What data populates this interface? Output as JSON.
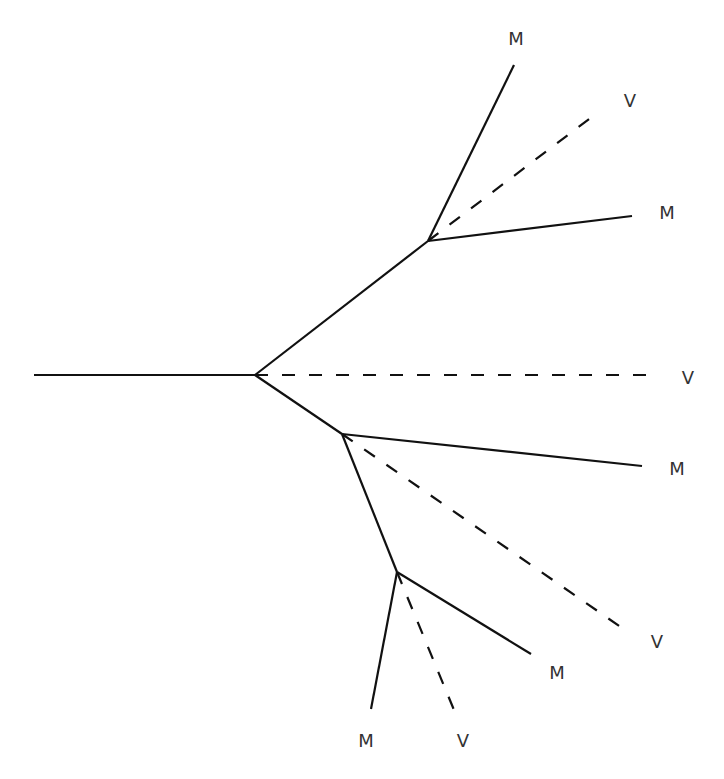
{
  "diagram": {
    "type": "phylogenetic-tree",
    "stroke_color": "#111111",
    "label_color": "#333333",
    "legend_semantics": {
      "solid": "M",
      "dashed": "V"
    },
    "nodes": {
      "root_start": [
        34,
        375
      ],
      "n1": [
        255,
        375
      ],
      "n2": [
        428,
        241
      ],
      "n3": [
        342,
        434
      ],
      "n4": [
        397,
        572
      ]
    },
    "edges": [
      {
        "from": [
          34,
          375
        ],
        "to": [
          255,
          375
        ],
        "style": "solid"
      },
      {
        "from": [
          255,
          375
        ],
        "to": [
          428,
          241
        ],
        "style": "solid"
      },
      {
        "from": [
          255,
          375
        ],
        "to": [
          342,
          434
        ],
        "style": "solid"
      },
      {
        "from": [
          342,
          434
        ],
        "to": [
          397,
          572
        ],
        "style": "solid"
      },
      {
        "from": [
          428,
          241
        ],
        "to": [
          514,
          65
        ],
        "style": "solid"
      },
      {
        "from": [
          428,
          241
        ],
        "to": [
          593,
          116
        ],
        "style": "dashed"
      },
      {
        "from": [
          428,
          241
        ],
        "to": [
          632,
          216
        ],
        "style": "solid"
      },
      {
        "from": [
          255,
          375
        ],
        "to": [
          650,
          375
        ],
        "style": "dashed"
      },
      {
        "from": [
          342,
          434
        ],
        "to": [
          642,
          466
        ],
        "style": "solid"
      },
      {
        "from": [
          342,
          434
        ],
        "to": [
          625,
          630
        ],
        "style": "dashed"
      },
      {
        "from": [
          397,
          572
        ],
        "to": [
          531,
          654
        ],
        "style": "solid"
      },
      {
        "from": [
          397,
          572
        ],
        "to": [
          454,
          710
        ],
        "style": "dashed"
      },
      {
        "from": [
          397,
          572
        ],
        "to": [
          371,
          709
        ],
        "style": "solid"
      }
    ],
    "leaves": [
      {
        "label": "M",
        "x": 516,
        "y": 39
      },
      {
        "label": "V",
        "x": 630,
        "y": 101
      },
      {
        "label": "M",
        "x": 667,
        "y": 213
      },
      {
        "label": "V",
        "x": 688,
        "y": 378
      },
      {
        "label": "M",
        "x": 677,
        "y": 469
      },
      {
        "label": "V",
        "x": 657,
        "y": 642
      },
      {
        "label": "M",
        "x": 557,
        "y": 673
      },
      {
        "label": "M",
        "x": 366,
        "y": 741
      },
      {
        "label": "V",
        "x": 463,
        "y": 741
      }
    ]
  }
}
